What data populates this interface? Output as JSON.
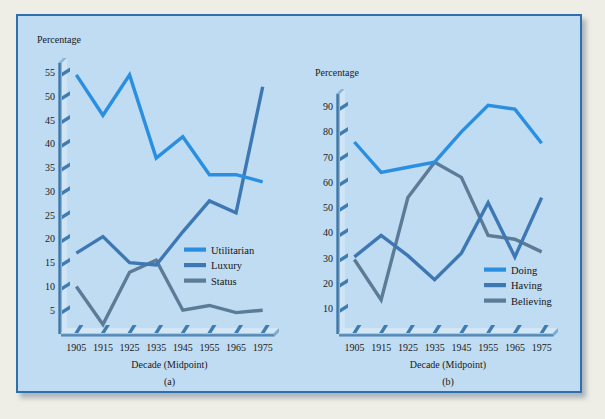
{
  "figure": {
    "background_color": "#efeee6",
    "panel_color": "#bfdcf2",
    "panel_border_color": "#2f6fae"
  },
  "colors": {
    "series_1": "#2a8fe0",
    "series_2": "#3d78b4",
    "series_3": "#5b7b96",
    "axis": "#3a6f9e",
    "text": "#1a1a1a"
  },
  "chart_data": [
    {
      "type": "line",
      "id": "a",
      "caption": "(a)",
      "title": "",
      "ylabel": "Percentage",
      "xlabel": "Decade (Midpoint)",
      "x": [
        1905,
        1915,
        1925,
        1935,
        1945,
        1955,
        1965,
        1975
      ],
      "xticklabels": [
        "1905",
        "1915",
        "1925",
        "1935",
        "1945",
        "1955",
        "1965",
        "1975"
      ],
      "yticks": [
        5,
        10,
        15,
        20,
        25,
        30,
        35,
        40,
        45,
        50,
        55
      ],
      "yticklabels": [
        "5",
        "10",
        "15",
        "20",
        "25",
        "30",
        "35",
        "40",
        "45",
        "50",
        "55"
      ],
      "ylim": [
        0,
        57
      ],
      "xlim": [
        1900,
        1980
      ],
      "grid": false,
      "legend_position": "center-right",
      "series": [
        {
          "name": "Utilitarian",
          "color": "#2a8fe0",
          "values": [
            54.5,
            46.0,
            54.5,
            37.0,
            41.5,
            33.5,
            33.5,
            32.0
          ]
        },
        {
          "name": "Luxury",
          "color": "#3d78b4",
          "values": [
            17.0,
            20.5,
            15.0,
            14.5,
            21.5,
            28.0,
            25.5,
            52.0
          ]
        },
        {
          "name": "Status",
          "color": "#5b7b96",
          "values": [
            10.0,
            2.0,
            13.0,
            15.5,
            5.0,
            6.0,
            4.5,
            5.0
          ]
        }
      ]
    },
    {
      "type": "line",
      "id": "b",
      "caption": "(b)",
      "title": "",
      "ylabel": "Percentage",
      "xlabel": "Decade (Midpoint)",
      "x": [
        1905,
        1915,
        1925,
        1935,
        1945,
        1955,
        1965,
        1975
      ],
      "xticklabels": [
        "1905",
        "1915",
        "1925",
        "1935",
        "1945",
        "1955",
        "1965",
        "1975"
      ],
      "yticks": [
        10,
        20,
        30,
        40,
        50,
        60,
        70,
        80,
        90
      ],
      "yticklabels": [
        "10",
        "20",
        "30",
        "40",
        "50",
        "60",
        "70",
        "80",
        "90"
      ],
      "ylim": [
        0,
        95
      ],
      "xlim": [
        1900,
        1980
      ],
      "grid": false,
      "legend_position": "center-right",
      "series": [
        {
          "name": "Doing",
          "color": "#2a8fe0",
          "values": [
            76.0,
            64.0,
            66.0,
            68.0,
            80.0,
            90.5,
            89.0,
            75.5
          ]
        },
        {
          "name": "Having",
          "color": "#3d78b4",
          "values": [
            30.5,
            39.0,
            31.0,
            21.5,
            32.0,
            52.0,
            30.5,
            54.0
          ]
        },
        {
          "name": "Believing",
          "color": "#5b7b96",
          "values": [
            29.5,
            13.5,
            54.0,
            68.0,
            62.0,
            39.0,
            37.5,
            32.5
          ]
        }
      ]
    }
  ]
}
